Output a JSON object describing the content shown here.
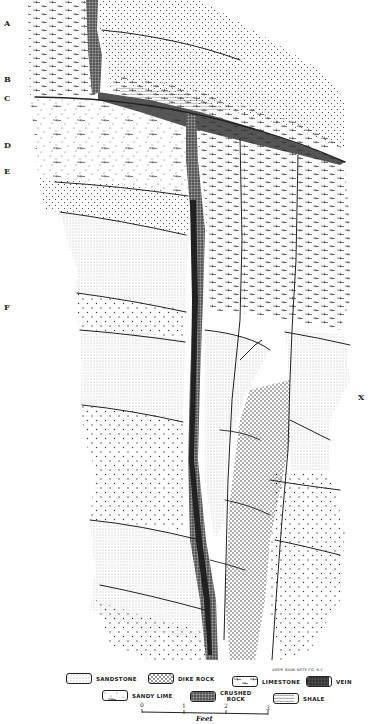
{
  "figure": {
    "type": "geological-cross-section",
    "side_labels": [
      "A",
      "B",
      "C",
      "D",
      "E",
      "F",
      "X"
    ],
    "colors": {
      "ink": "#222222",
      "paper": "#ffffff"
    }
  },
  "legend": {
    "items": [
      {
        "key": "sandstone",
        "label": "SANDSTONE"
      },
      {
        "key": "dike_rock",
        "label": "DIKE ROCK"
      },
      {
        "key": "limestone",
        "label": "LIMESTONE"
      },
      {
        "key": "vein",
        "label": "VEIN"
      },
      {
        "key": "sandy_lime",
        "label": "SANDY LIME"
      },
      {
        "key": "crushed_rock",
        "label_line1": "CRUSHED",
        "label_line2": "ROCK"
      },
      {
        "key": "shale",
        "label": "SHALE"
      }
    ]
  },
  "credit": "AMER. BANK NOTE CO. N.Y.",
  "scale_bar": {
    "ticks": [
      "0",
      "1",
      "2",
      "3"
    ],
    "unit": "Feet"
  }
}
